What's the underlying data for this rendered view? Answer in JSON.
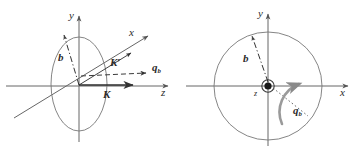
{
  "figure": {
    "background_color": "#ffffff",
    "line_color": "#555555",
    "label_color": "#2b2b2b",
    "width": 361,
    "height": 159
  },
  "panels": [
    {
      "id": "left",
      "name": "oblique-3d-view",
      "description": "Oblique view with x, y, z axes, an ellipse (circle seen edge-on) in the x-y plane, incoming momentum K along z, scattered momentum K' and transfer q_b",
      "axes": [
        {
          "name": "y-axis",
          "label": "y",
          "direction": "up"
        },
        {
          "name": "x-axis",
          "label": "x",
          "direction": "up-right"
        },
        {
          "name": "z-axis",
          "label": "z",
          "direction": "right"
        }
      ],
      "labels": {
        "y": "y",
        "x": "x",
        "z": "z",
        "b": "b",
        "K": "K",
        "K_prime": "K′",
        "q_b": "q",
        "q_b_sub": "b"
      },
      "shapes": [
        {
          "name": "impact-circle-ellipse",
          "type": "ellipse",
          "style": "solid"
        },
        {
          "name": "impact-parameter-arrow",
          "type": "arrow",
          "style": "dash-dot",
          "label": "b"
        },
        {
          "name": "incoming-momentum-vector",
          "type": "arrow",
          "style": "solid",
          "label": "K"
        },
        {
          "name": "scattered-momentum-vector",
          "type": "arrow",
          "style": "solid",
          "label": "K′"
        },
        {
          "name": "momentum-transfer-arrow",
          "type": "arrow",
          "style": "dashed",
          "label": "q_b"
        }
      ]
    },
    {
      "id": "right",
      "name": "transverse-plane-view",
      "description": "Transverse (x-y) plane view looking down the z axis; z axis points out of page (dot in circle), impact parameter b and azimuthal momentum transfer q_b shown as curved arrow",
      "axes": [
        {
          "name": "y-axis",
          "label": "y",
          "direction": "up"
        },
        {
          "name": "x-axis",
          "label": "x",
          "direction": "right"
        },
        {
          "name": "z-axis",
          "label": "z",
          "direction": "out-of-page"
        }
      ],
      "labels": {
        "y": "y",
        "x": "x",
        "z": "z",
        "b": "b",
        "q_b": "q",
        "q_b_sub": "b"
      },
      "shapes": [
        {
          "name": "impact-circle",
          "type": "circle",
          "style": "solid"
        },
        {
          "name": "out-of-page-marker",
          "type": "dot-in-circle",
          "label": "z"
        },
        {
          "name": "impact-parameter-arrow",
          "type": "arrow",
          "style": "dash-dot",
          "label": "b"
        },
        {
          "name": "momentum-transfer-curved-arrow",
          "type": "curved-arrow",
          "style": "solid",
          "label": "q_b"
        },
        {
          "name": "radial-dotted-line",
          "type": "line",
          "style": "dotted"
        }
      ]
    }
  ]
}
